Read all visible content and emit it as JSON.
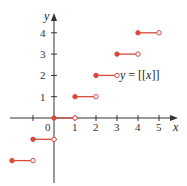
{
  "chart_data": {
    "type": "line",
    "title": "",
    "function_label": "y = [[x]]",
    "function_label_parts": {
      "y": "y",
      "eq": " = ",
      "open": "[[",
      "x": "x",
      "close": "]]"
    },
    "xlabel": "x",
    "ylabel": "y",
    "xlim": [
      -2.5,
      5.8
    ],
    "ylim": [
      -2.3,
      4.8
    ],
    "grid": false,
    "x_ticks": [
      -1,
      0,
      1,
      2,
      3,
      4,
      5
    ],
    "x_tick_labels": [
      "0",
      "1",
      "2",
      "3",
      "4",
      "5"
    ],
    "y_ticks": [
      -1,
      1,
      2,
      3,
      4
    ],
    "y_tick_labels": [
      "1",
      "2",
      "3",
      "4"
    ],
    "origin_label": "0",
    "series": [
      {
        "name": "greatest integer function",
        "color": "#d9493b",
        "segments": [
          {
            "x_start": -2,
            "x_end": -1,
            "y": -2,
            "start_closed": true,
            "end_closed": false
          },
          {
            "x_start": -1,
            "x_end": 0,
            "y": -1,
            "start_closed": true,
            "end_closed": false
          },
          {
            "x_start": 0,
            "x_end": 1,
            "y": 0,
            "start_closed": true,
            "end_closed": false
          },
          {
            "x_start": 1,
            "x_end": 2,
            "y": 1,
            "start_closed": true,
            "end_closed": false
          },
          {
            "x_start": 2,
            "x_end": 3,
            "y": 2,
            "start_closed": true,
            "end_closed": false
          },
          {
            "x_start": 3,
            "x_end": 4,
            "y": 3,
            "start_closed": true,
            "end_closed": false
          },
          {
            "x_start": 4,
            "x_end": 5,
            "y": 4,
            "start_closed": true,
            "end_closed": false
          }
        ]
      }
    ]
  }
}
